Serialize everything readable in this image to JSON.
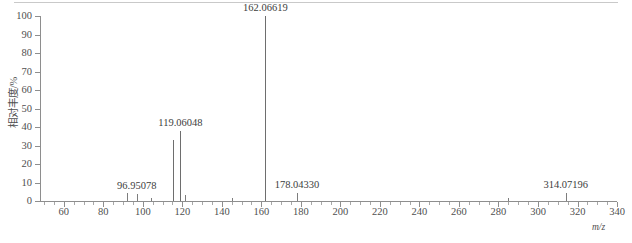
{
  "figure": {
    "type": "mass-spectrum",
    "x_axis_title": "m/z",
    "y_axis_title": "相对丰度/%"
  },
  "axes": {
    "x_ticks_major": [
      60,
      80,
      100,
      120,
      140,
      160,
      180,
      200,
      220,
      240,
      260,
      280,
      300,
      320,
      340
    ],
    "x_minor_step": 5,
    "x_range": [
      48,
      340
    ],
    "y_ticks": [
      0,
      10,
      20,
      30,
      40,
      50,
      60,
      70,
      80,
      90,
      100
    ],
    "y_range": [
      0,
      100
    ]
  },
  "chart_data": {
    "type": "bar",
    "title": "",
    "xlabel": "m/z",
    "ylabel": "相对丰度/%",
    "xlim": [
      48,
      340
    ],
    "ylim": [
      0,
      100
    ],
    "grid": false,
    "legend": "none",
    "x": [
      92.0,
      96.95078,
      104.0,
      115.05,
      119.06048,
      121.5,
      144.9,
      162.06619,
      178.0433,
      285.0,
      314.07196
    ],
    "values": [
      4.5,
      4.0,
      1.5,
      33.0,
      38.0,
      3.0,
      1.5,
      100.0,
      4.5,
      1.5,
      4.5
    ],
    "labeled_peaks": [
      {
        "mz": "96.95078",
        "intensity": 4.0
      },
      {
        "mz": "119.06048",
        "intensity": 38.0
      },
      {
        "mz": "162.06619",
        "intensity": 100.0
      },
      {
        "mz": "178.04330",
        "intensity": 4.5
      },
      {
        "mz": "314.07196",
        "intensity": 4.5
      }
    ]
  },
  "colors": {
    "axis": "#8e8e8e",
    "peak": "#7d7d7d",
    "text": "#4f4f4f",
    "rule": "#c9c9c9",
    "background": "#ffffff"
  }
}
